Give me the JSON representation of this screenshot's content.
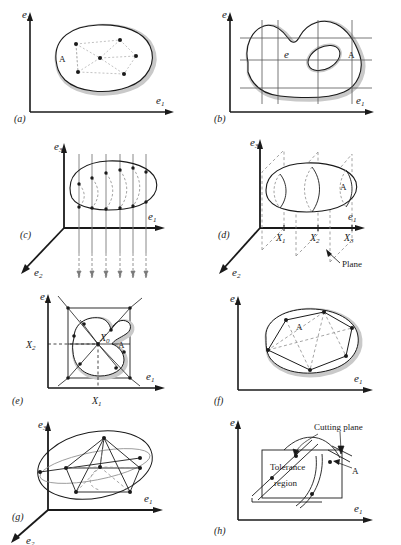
{
  "figure": {
    "width": 401,
    "height": 545,
    "colors": {
      "ink": "#1a1a1a",
      "shadow": "#c9c9c9",
      "dashed": "#8d8d8d",
      "grid": "#555555",
      "fill": "#ffffff"
    }
  },
  "axes": {
    "e1": {
      "letter": "e",
      "sub": "1"
    },
    "e2": {
      "letter": "e",
      "sub": "2"
    },
    "e3": {
      "letter": "e",
      "sub": "3"
    }
  },
  "panels": [
    {
      "id": "(a)",
      "name": "panel-a",
      "axis_labels": [
        "e2",
        "e1"
      ],
      "region_label": "A",
      "description": "blob with interior sample points joined by dashed network",
      "point_count": 6
    },
    {
      "id": "(b)",
      "name": "panel-b",
      "axis_labels": [
        "e2",
        "e1"
      ],
      "region_label": "A",
      "inner_label": "e",
      "description": "irregular region with inner hole overlaid by rectangular grid",
      "grid_vertical": 4,
      "grid_horizontal": 4
    },
    {
      "id": "(c)",
      "name": "panel-c",
      "axis_labels": [
        "e3",
        "e1",
        "e2"
      ],
      "description": "3D blob probed by vertical measuring lines",
      "probe_count": 6
    },
    {
      "id": "(d)",
      "name": "panel-d",
      "axis_labels": [
        "e3",
        "e1",
        "e2"
      ],
      "region_label": "A",
      "annotation": "Plane",
      "tick_labels": [
        {
          "letter": "X",
          "sub": "1"
        },
        {
          "letter": "X",
          "sub": "2"
        },
        {
          "letter": "X",
          "sub": "3"
        }
      ],
      "description": "3D blob sectioned by dashed cutting planes"
    },
    {
      "id": "(e)",
      "name": "panel-e",
      "axis_labels": [
        "e2",
        "e1"
      ],
      "region_label": "A",
      "center_label": {
        "letter": "X",
        "sub": "0"
      },
      "tick_labels": [
        {
          "letter": "X",
          "sub": "2"
        },
        {
          "letter": "X",
          "sub": "1"
        }
      ],
      "description": "blob in bounding box with radial rays from centre point"
    },
    {
      "id": "(f)",
      "name": "panel-f",
      "axis_labels": [
        "e2",
        "e1"
      ],
      "region_label": "A",
      "description": "convex polygon inscribed in blob with dashed diagonals",
      "vertex_count": 6
    },
    {
      "id": "(g)",
      "name": "panel-g",
      "axis_labels": [
        "e3",
        "e1",
        "e2"
      ],
      "description": "3D ellipsoid with inscribed polyhedron",
      "vertex_count": 6
    },
    {
      "id": "(h)",
      "name": "panel-h",
      "axis_labels": [
        "e2",
        "e1"
      ],
      "region_label": "A",
      "annotations": [
        "Cutting plane",
        "Tolerance region"
      ],
      "description": "tolerance rectangle crossed by cutting plane curves"
    }
  ]
}
